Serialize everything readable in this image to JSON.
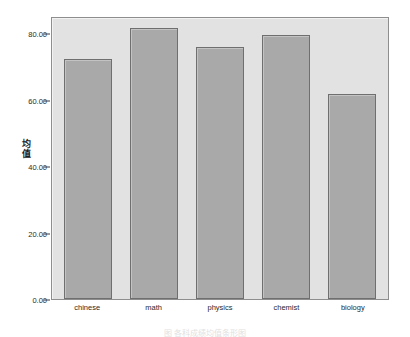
{
  "chart_data": {
    "type": "bar",
    "title": "",
    "xlabel": "",
    "ylabel": "均值",
    "ylabel_chars": [
      "均",
      "值"
    ],
    "categories": [
      "chinese",
      "math",
      "physics",
      "chemist",
      "biology"
    ],
    "values": [
      71.0,
      80.0,
      74.3,
      77.9,
      60.5
    ],
    "ylim": [
      0.0,
      83.0
    ],
    "y_ticks": [
      0.0,
      20.0,
      40.0,
      60.0,
      80.0
    ],
    "y_tick_labels": [
      "0.00",
      "20.00",
      "40.00",
      "60.00",
      "80.00"
    ],
    "grid": false,
    "legend": null,
    "legend_position": "none",
    "bar_fill_color": "#a9a9a9",
    "bar_edge_color": "#6f6f6f",
    "plot_background_color": "#e2e2e2",
    "frame_color": "#8e8e8e",
    "series": [
      {
        "name": "均值",
        "values": [
          71.0,
          80.0,
          74.3,
          77.9,
          60.5
        ]
      }
    ]
  },
  "caption": {
    "text": "图  各科成绩均值条形图"
  }
}
